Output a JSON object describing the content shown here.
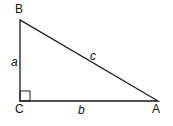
{
  "diagram": {
    "type": "right-triangle",
    "vertices": [
      {
        "name": "B",
        "label": "B"
      },
      {
        "name": "C",
        "label": "C"
      },
      {
        "name": "A",
        "label": "A"
      }
    ],
    "sides": [
      {
        "name": "a",
        "label": "a",
        "between": "B-C"
      },
      {
        "name": "b",
        "label": "b",
        "between": "C-A"
      },
      {
        "name": "c",
        "label": "c",
        "between": "B-A"
      }
    ],
    "right_angle_at": "C",
    "colors": {
      "stroke": "#1a1a1a",
      "background": "#ffffff"
    }
  }
}
